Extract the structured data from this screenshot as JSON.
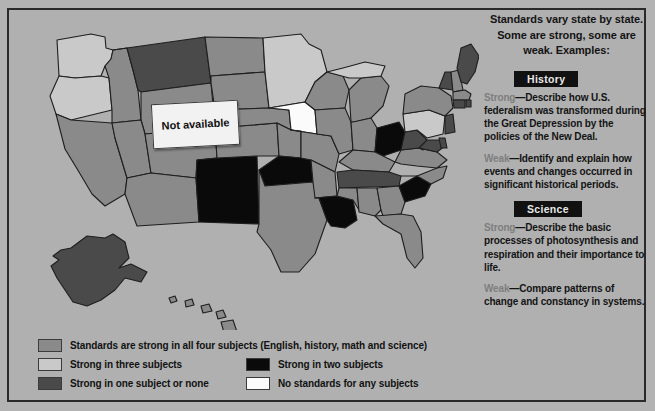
{
  "panel": {
    "heading_lines": "Standards vary state by state. Some are strong, some are weak. Examples:",
    "history": {
      "badge": "History",
      "strong_label": "Strong",
      "strong_text": "—Describe how U.S. federalism was transformed during the Great Depression by the policies of the New Deal.",
      "weak_label": "Weak",
      "weak_text": "—Identify and explain how events and changes occurred in significant historical periods."
    },
    "science": {
      "badge": "Science",
      "strong_label": "Strong",
      "strong_text": "—Describe the basic processes of photosynthesis and respiration and their importance to life.",
      "weak_label": "Weak",
      "weak_text": "—Compare patterns of change and constancy in systems."
    }
  },
  "map": {
    "callout": "Not available"
  },
  "legend": {
    "items": [
      {
        "key": "all4",
        "label": "Standards are strong in all four subjects (English, history, math and science)",
        "color": "#8a8a8a"
      },
      {
        "key": "three",
        "label": "Strong in three subjects",
        "color": "#c9c9c9"
      },
      {
        "key": "two",
        "label": "Strong in two subjects",
        "color": "#0a0a0a"
      },
      {
        "key": "one",
        "label": "Strong in one subject or none",
        "color": "#4a4a4a"
      },
      {
        "key": "none",
        "label": "No standards for any subjects",
        "color": "#fbfbfb"
      }
    ]
  },
  "colors": {
    "background": "#b3b3b3",
    "frame": "#2a2a2a",
    "strong_all_four": "#8a8a8a",
    "strong_three": "#c9c9c9",
    "strong_two": "#0a0a0a",
    "strong_one_or_none": "#4a4a4a",
    "no_standards": "#fbfbfb",
    "state_outline": "#1e1e1e",
    "badge_bg": "#111111",
    "badge_text": "#e8e8e8",
    "lead_word": "#7e7e7e"
  }
}
